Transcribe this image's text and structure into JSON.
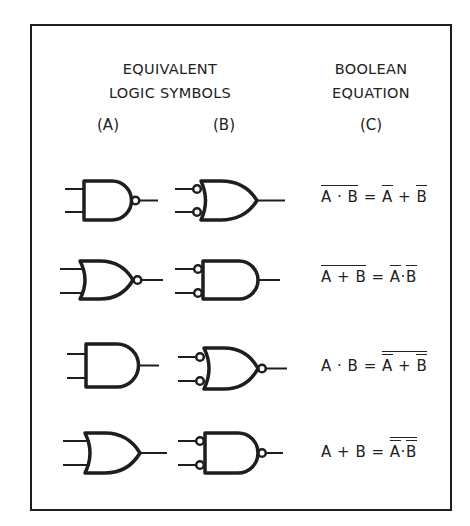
{
  "headers": {
    "symbols_line1": "EQUIVALENT",
    "symbols_line2": "LOGIC SYMBOLS",
    "equation_line1": "BOOLEAN",
    "equation_line2": "EQUATION"
  },
  "column_labels": {
    "a": "(A)",
    "b": "(B)",
    "c": "(C)"
  },
  "rows": [
    {
      "gate_a": "NAND (AND with output bubble)",
      "gate_b": "OR with inverted inputs",
      "equation": {
        "lhs": "A·B",
        "lhs_bar": "full",
        "rhs": "Ā + B̄"
      },
      "eq_text": {
        "l1": "A",
        "op_l": "·",
        "l2": "B",
        "eq": "=",
        "r1": "A",
        "op_r": "+",
        "r2": "B"
      }
    },
    {
      "gate_a": "NOR (OR with output bubble)",
      "gate_b": "AND with inverted inputs",
      "equation": {
        "lhs": "A+B",
        "lhs_bar": "full",
        "rhs": "Ā·B̄"
      },
      "eq_text": {
        "l1": "A",
        "op_l": "+",
        "l2": "B",
        "eq": "=",
        "r1": "A",
        "op_r": "·",
        "r2": "B"
      }
    },
    {
      "gate_a": "AND",
      "gate_b": "NOR with inverted inputs",
      "equation": {
        "lhs": "A·B",
        "rhs": "Ā + B̄ (double bar over whole)"
      },
      "eq_text": {
        "l1": "A",
        "op_l": "·",
        "l2": "B",
        "eq": "=",
        "r1": "A",
        "op_r": "+",
        "r2": "B"
      }
    },
    {
      "gate_a": "OR",
      "gate_b": "NAND with inverted inputs",
      "equation": {
        "lhs": "A+B",
        "rhs": "Ā·B̄ (double bar over whole)"
      },
      "eq_text": {
        "l1": "A",
        "op_l": "+",
        "l2": "B",
        "eq": "=",
        "r1": "A",
        "op_r": "·",
        "r2": "B"
      }
    }
  ],
  "colors": {
    "ink": "#1e1e1e",
    "background": "#ffffff"
  }
}
